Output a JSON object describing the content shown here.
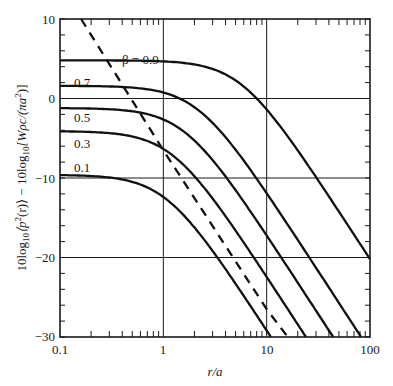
{
  "chart_data": {
    "type": "line",
    "title": "",
    "xlabel": "r/a",
    "ylabel": "10log10⟨p²(r)⟩ − 10log10[Wρc/(πa²)]",
    "xscale": "log",
    "xlim": [
      0.1,
      100
    ],
    "ylim": [
      -30,
      10
    ],
    "x_ticks": [
      "0.1",
      "1",
      "10",
      "100"
    ],
    "y_ticks": [
      "10",
      "0",
      "−10",
      "−20",
      "−30"
    ],
    "grid": true,
    "legend": "inline curve labels",
    "series": [
      {
        "name": "β = 0.9",
        "label": "β = 0.9",
        "style": "solid",
        "plateau_db": 4.8,
        "x": [
          0.1,
          0.3,
          1,
          2,
          3,
          10,
          30,
          100
        ],
        "y": [
          4.8,
          4.6,
          3.8,
          2.3,
          0.9,
          -5.6,
          -14.5,
          -20.2
        ]
      },
      {
        "name": "β = 0.7",
        "label": "0.7",
        "style": "solid",
        "plateau_db": 1.6,
        "x": [
          0.1,
          0.3,
          1,
          2,
          3,
          10,
          30,
          82
        ],
        "y": [
          1.6,
          1.4,
          0.0,
          -2.3,
          -4.4,
          -13.4,
          -22.8,
          -30
        ]
      },
      {
        "name": "β = 0.5",
        "label": "0.5",
        "style": "solid",
        "plateau_db": -1.2,
        "x": [
          0.1,
          0.3,
          1,
          2,
          3,
          10,
          30,
          44
        ],
        "y": [
          -1.2,
          -1.5,
          -3.5,
          -6.6,
          -9.3,
          -19.0,
          -28.5,
          -30
        ]
      },
      {
        "name": "β = 0.3",
        "label": "0.3",
        "style": "solid",
        "plateau_db": -4.1,
        "x": [
          0.1,
          0.3,
          1,
          2,
          3,
          10,
          24
        ],
        "y": [
          -4.1,
          -4.6,
          -7.2,
          -10.9,
          -13.8,
          -23.5,
          -30
        ]
      },
      {
        "name": "β = 0.1",
        "label": "0.1",
        "style": "solid",
        "plateau_db": -9.6,
        "x": [
          0.1,
          0.3,
          1,
          2,
          3,
          10,
          11
        ],
        "y": [
          -9.6,
          -10.3,
          -13.8,
          -17.5,
          -20.5,
          -29.3,
          -30
        ]
      },
      {
        "name": "far-field asymptote",
        "label": "",
        "style": "dashed",
        "x": [
          0.16,
          1,
          10,
          16
        ],
        "y": [
          10,
          -6.5,
          -26.5,
          -30
        ]
      }
    ]
  },
  "labels": {
    "x_axis": "r/a",
    "y_axis_left": "10log",
    "y_axis_sub1": "10",
    "y_axis_mid": "⟨p",
    "y_axis_sup": "2",
    "y_axis_mid2": "(r)⟩ − 10log",
    "y_axis_sub2": "10",
    "y_axis_right": "[Wρc/(πa",
    "y_axis_sup2": "2",
    "y_axis_end": ")]",
    "x_ticks": [
      "0.1",
      "1",
      "10",
      "100"
    ],
    "y_ticks": [
      "10",
      "0",
      "−10",
      "−20",
      "−30"
    ],
    "curves": [
      "β = 0.9",
      "0.7",
      "0.5",
      "0.3",
      "0.1"
    ]
  }
}
